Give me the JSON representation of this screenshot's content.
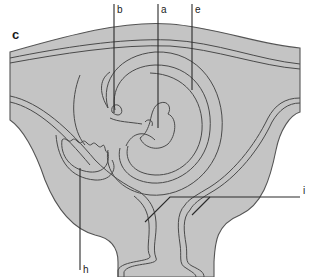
{
  "figure": {
    "panel_label": "c",
    "labels": {
      "a": "a",
      "b": "b",
      "e": "e",
      "h": "h",
      "i": "i"
    },
    "colors": {
      "tissue": "#c4c4c4",
      "outline": "#4a4a4a",
      "background": "#ffffff"
    }
  }
}
